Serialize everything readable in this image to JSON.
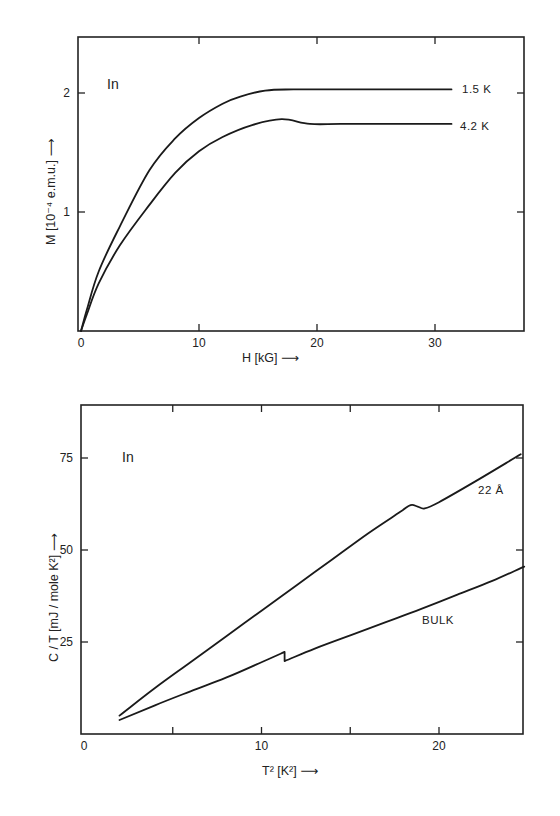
{
  "chart_data": [
    {
      "type": "line",
      "title": "",
      "element_label": "In",
      "xlabel": "H [kG]",
      "ylabel": "M [10^-4 e.m.u.]",
      "xlim": [
        0,
        37.5
      ],
      "ylim": [
        0,
        2.45
      ],
      "x_ticks": [
        0,
        10,
        20,
        30
      ],
      "x_tick_labels": [
        "0",
        "10",
        "20",
        "30"
      ],
      "y_ticks": [
        1,
        2
      ],
      "y_tick_labels": [
        "1",
        "2"
      ],
      "grid": false,
      "legend": "inline labels at curve ends",
      "series": [
        {
          "name": "1.5 K",
          "label": "1.5 K",
          "x": [
            0,
            0.5,
            1.5,
            3.3,
            5.8,
            8,
            10,
            12,
            13.5,
            15.6,
            18,
            22,
            26,
            31.4
          ],
          "y": [
            0,
            0.18,
            0.5,
            0.88,
            1.35,
            1.62,
            1.79,
            1.91,
            1.97,
            2.02,
            2.03,
            2.03,
            2.03,
            2.03
          ]
        },
        {
          "name": "4.2 K",
          "label": "4.2 K",
          "x": [
            0,
            0.5,
            1.5,
            3.3,
            5.8,
            8,
            10,
            12,
            14.5,
            17,
            19.4,
            22,
            26,
            31.4
          ],
          "y": [
            0,
            0.14,
            0.4,
            0.72,
            1.06,
            1.33,
            1.51,
            1.63,
            1.73,
            1.78,
            1.74,
            1.74,
            1.74,
            1.74
          ]
        }
      ]
    },
    {
      "type": "line",
      "title": "",
      "element_label": "In",
      "xlabel": "T² [K²]",
      "ylabel": "C/T [mJ/mole K²]",
      "xlim": [
        0,
        24.8
      ],
      "ylim": [
        0,
        89
      ],
      "x_ticks": [
        0,
        5,
        10,
        15,
        20
      ],
      "x_tick_labels": [
        "0",
        "",
        "10",
        "",
        "20"
      ],
      "y_ticks": [
        25,
        50,
        75
      ],
      "y_tick_labels": [
        "25",
        "50",
        "75"
      ],
      "grid": false,
      "legend": "inline labels near curves",
      "series": [
        {
          "name": "22 Å",
          "label": "22 Å",
          "x": [
            2.0,
            4,
            6,
            8,
            10,
            12,
            14,
            16,
            17.8,
            18.4,
            18.8,
            19.2,
            20,
            22,
            24.6
          ],
          "y": [
            5.0,
            12.5,
            19.5,
            26.5,
            33.5,
            40.5,
            47.5,
            54.5,
            60.3,
            62.2,
            61.8,
            61.3,
            63.0,
            68.5,
            76.0
          ]
        },
        {
          "name": "BULK",
          "label": "BULK",
          "x": [
            2.0,
            4,
            6,
            8,
            10,
            11.3,
            11.3,
            13,
            15,
            17,
            19,
            21,
            23,
            24.8
          ],
          "y": [
            3.8,
            7.8,
            11.6,
            15.3,
            19.5,
            22.3,
            19.8,
            23.2,
            26.8,
            30.4,
            34.0,
            37.8,
            41.6,
            45.5
          ]
        }
      ]
    }
  ],
  "top_chart": {
    "element": "In",
    "xlabel": "H [kG] ⟶",
    "ylabel": "M [10⁻⁴ e.m.u.] ⟶",
    "labels": {
      "s1": "1.5 K",
      "s2": "4.2 K"
    }
  },
  "bottom_chart": {
    "element": "In",
    "xlabel": "T² [K²] ⟶",
    "ylabel": "C / T [mJ / mole K²] ⟶",
    "labels": {
      "s1": "22 Å",
      "s2": "BULK"
    }
  },
  "colors": {
    "ink": "#1a1a1a",
    "paper": "#ffffff"
  }
}
